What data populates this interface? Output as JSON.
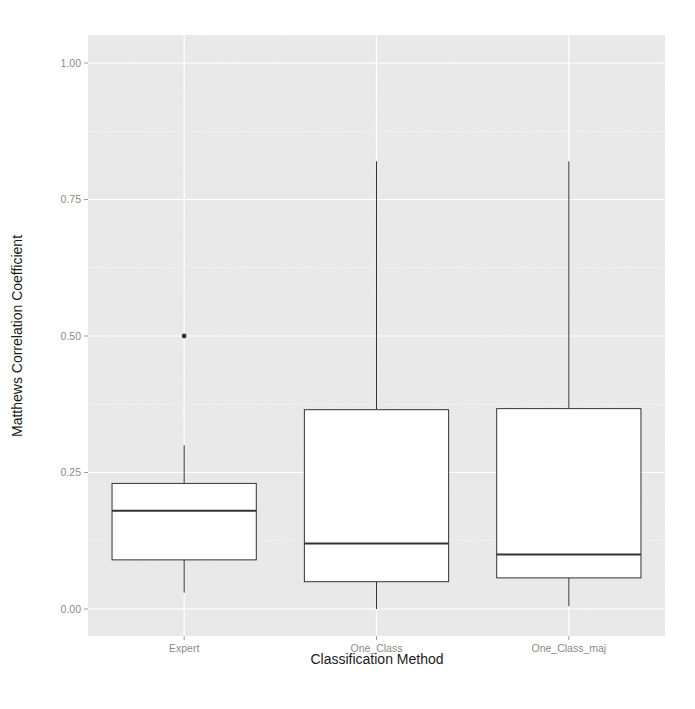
{
  "chart_data": {
    "type": "boxplot",
    "title": "",
    "xlabel": "Classification Method",
    "ylabel": "Matthews Correlation Coefficient",
    "categories": [
      "Expert",
      "One_Class",
      "One_Class_maj"
    ],
    "ylim": [
      -0.05,
      1.05
    ],
    "yticks": [
      0.0,
      0.25,
      0.5,
      0.75,
      1.0
    ],
    "ytick_labels": [
      "0.00",
      "0.25",
      "0.50",
      "0.75",
      "1.00"
    ],
    "grid": true,
    "legend": null,
    "boxes": [
      {
        "category": "Expert",
        "whisker_low": 0.03,
        "q1": 0.09,
        "median": 0.18,
        "q3": 0.23,
        "whisker_high": 0.3,
        "outliers": [
          0.5
        ]
      },
      {
        "category": "One_Class",
        "whisker_low": 0.0,
        "q1": 0.05,
        "median": 0.12,
        "q3": 0.365,
        "whisker_high": 0.82,
        "outliers": []
      },
      {
        "category": "One_Class_maj",
        "whisker_low": 0.005,
        "q1": 0.057,
        "median": 0.1,
        "q3": 0.367,
        "whisker_high": 0.82,
        "outliers": []
      }
    ]
  },
  "style": {
    "panel_background": "#ebebeb",
    "grid_color": "#ffffff",
    "box_fill": "#ffffff",
    "box_stroke": "#333333",
    "outlier_color": "#333333",
    "tick_label_color": "#8a8a8a",
    "axis_title_color": "#1a1a1a"
  }
}
